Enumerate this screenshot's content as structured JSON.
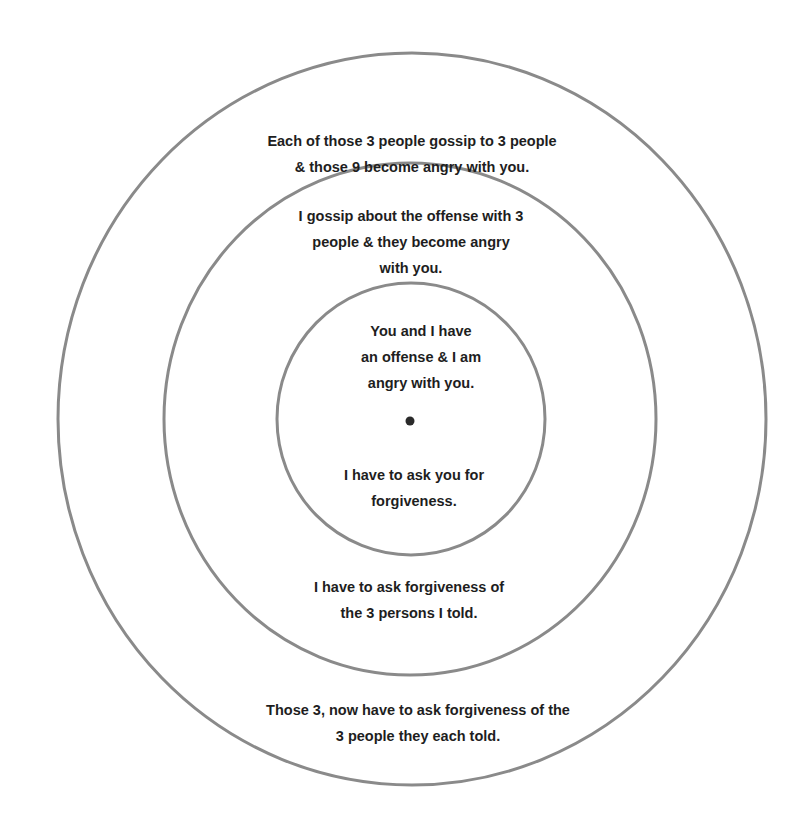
{
  "diagram": {
    "type": "concentric-circles",
    "colors": {
      "ring_stroke": "#8a8a8a",
      "text": "#1e1e1e",
      "center_dot": "#2a2a2a",
      "background": "#ffffff"
    },
    "rings": [
      {
        "name": "inner",
        "top_text": [
          "You and I have",
          "an offense & I am",
          "angry with you."
        ],
        "bottom_text": [
          "I have to ask you for",
          "forgiveness."
        ]
      },
      {
        "name": "middle",
        "top_text": [
          "I gossip about the offense with 3",
          "people & they become angry",
          "with you."
        ],
        "bottom_text": [
          "I have to ask forgiveness of",
          "the 3 persons I told."
        ]
      },
      {
        "name": "outer",
        "top_text": [
          "Each of those 3 people gossip to 3 people",
          "& those 9 become angry with you."
        ],
        "bottom_text": [
          "Those 3, now have to ask forgiveness of the",
          "3 people they each told."
        ]
      }
    ]
  }
}
